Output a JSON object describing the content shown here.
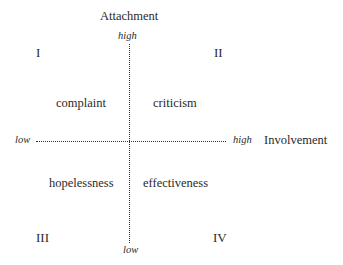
{
  "diagram": {
    "vertical_axis": {
      "title": "Attachment",
      "high_label": "high",
      "low_label": "low"
    },
    "horizontal_axis": {
      "title": "Involvement",
      "high_label": "high",
      "low_label": "low"
    },
    "quadrants": [
      {
        "numeral": "I",
        "term": "complaint"
      },
      {
        "numeral": "II",
        "term": "criticism"
      },
      {
        "numeral": "III",
        "term": "hopelessness"
      },
      {
        "numeral": "IV",
        "term": "effectiveness"
      }
    ]
  }
}
